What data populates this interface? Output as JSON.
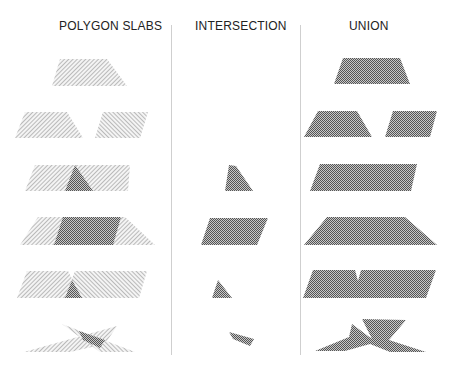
{
  "columns": [
    {
      "title": "POLYGON SLABS",
      "x": 59
    },
    {
      "title": "INTERSECTION",
      "x": 195
    },
    {
      "title": "UNION",
      "x": 349
    }
  ],
  "colors": {
    "hatch": "#8a8a8a",
    "crosshatch_dark": "#5a5a5a",
    "crosshatch_light": "#c8c8c8",
    "divider": "#cfcfcf",
    "text": "#222222"
  },
  "rows": [
    {
      "slabs": [
        {
          "points": "60,59 107,59 127,86 52,86",
          "fill": "hatch"
        }
      ],
      "slab_overlap": [],
      "intersection": [],
      "union": [
        {
          "points": "343,58 400,58 410,84 334,84"
        }
      ]
    },
    {
      "slabs": [
        {
          "points": "25,112 67,112 83,138 15,138",
          "fill": "hatch"
        },
        {
          "points": "103,112 148,112 140,138 95,138",
          "fill": "hatch2"
        }
      ],
      "slab_overlap": [],
      "intersection": [],
      "union": [
        {
          "points": "318,111 357,111 372,137 304,137"
        },
        {
          "points": "393,111 437,111 430,137 385,137"
        }
      ]
    },
    {
      "slabs": [
        {
          "points": "35,165 130,165 128,191 25,191",
          "fill": "hatch"
        }
      ],
      "slab_overlap": [
        {
          "points": "75,165 93,191 65,191"
        }
      ],
      "intersection": [
        {
          "points": "229,165 236,166 253,191 225,191"
        }
      ],
      "union": [
        {
          "points": "320,164 417,164 411,191 310,191"
        }
      ]
    },
    {
      "slabs": [
        {
          "points": "38,217 125,217 155,245 20,245",
          "fill": "hatch"
        }
      ],
      "slab_overlap": [
        {
          "points": "63,217 121,217 113,245 54,245"
        }
      ],
      "intersection": [
        {
          "points": "210,218 268,218 257,245 201,245"
        }
      ],
      "union": [
        {
          "points": "327,217 405,217 437,245 304,245"
        }
      ]
    },
    {
      "slabs": [
        {
          "points": "27,271 68,271 82,298 17,298",
          "fill": "hatch"
        },
        {
          "points": "75,271 147,271 139,298 65,298",
          "fill": "hatch2"
        }
      ],
      "slab_overlap": [
        {
          "points": "72,280 82,298 65,298"
        }
      ],
      "intersection": [
        {
          "points": "218,280 232,298 212,298"
        }
      ],
      "union": [
        {
          "points": "313,270 355,270 358,281 361,270 436,270 426,298 303,298"
        }
      ]
    },
    {
      "slabs": [
        {
          "points": "24,352 117,326 105,344 70,352",
          "fill": "hatch"
        },
        {
          "points": "62,324 135,352 100,352",
          "fill": "hatch2"
        }
      ],
      "slab_overlap": [
        {
          "points": "79,331 105,340 100,348 83,340"
        }
      ],
      "intersection": [
        {
          "points": "229,332 254,339 250,346 233,339"
        }
      ],
      "union": [
        {
          "points": "315,351 349,337 352,324 372,339 362,319 406,320 389,340 426,352 390,352 370,344 345,351"
        }
      ]
    }
  ]
}
